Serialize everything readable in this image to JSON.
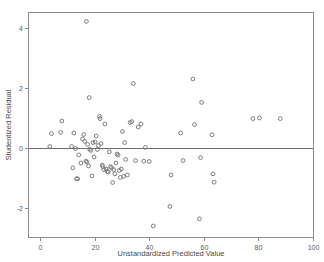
{
  "chart_data": {
    "type": "scatter",
    "title": "",
    "xlabel": "Unstandardized Predicted Value",
    "ylabel": "Studentized Residual",
    "xlim": [
      -2.5,
      102
    ],
    "ylim": [
      -3.0,
      4.7
    ],
    "xticks": [
      0,
      20,
      40,
      60,
      80,
      100
    ],
    "yticks": [
      -2,
      0,
      2,
      4
    ],
    "xtick_labels": [
      "0",
      "20",
      "40",
      "60",
      "80",
      "100"
    ],
    "ytick_labels": [
      "-2",
      "0",
      "2",
      "4"
    ],
    "grid": false,
    "legend": null,
    "reference_lines": [
      {
        "orientation": "horizontal",
        "y": 0,
        "color": "#6e6e6e"
      }
    ],
    "marker": {
      "shape": "open-circle",
      "radius": 1.9,
      "stroke": "#707070",
      "fill": "none"
    },
    "series": [
      {
        "name": "Residuals",
        "points": [
          [
            3.6,
            0.05
          ],
          [
            4.2,
            0.48
          ],
          [
            7.6,
            0.52
          ],
          [
            8.0,
            0.9
          ],
          [
            11.6,
            0.05
          ],
          [
            12.0,
            -0.66
          ],
          [
            12.4,
            0.5
          ],
          [
            13.0,
            -0.02
          ],
          [
            13.4,
            -1.02
          ],
          [
            13.8,
            -1.03
          ],
          [
            14.2,
            -0.23
          ],
          [
            15.0,
            -0.5
          ],
          [
            15.6,
            0.3
          ],
          [
            16.0,
            0.45
          ],
          [
            16.4,
            0.22
          ],
          [
            16.8,
            -0.44
          ],
          [
            17.0,
            4.22
          ],
          [
            17.2,
            -0.47
          ],
          [
            17.4,
            0.12
          ],
          [
            17.8,
            -0.6
          ],
          [
            18.0,
            1.68
          ],
          [
            18.2,
            -0.04
          ],
          [
            18.6,
            -0.08
          ],
          [
            19.0,
            -0.93
          ],
          [
            19.4,
            0.18
          ],
          [
            19.8,
            -0.3
          ],
          [
            20.2,
            0.2
          ],
          [
            20.6,
            0.4
          ],
          [
            21.0,
            -0.05
          ],
          [
            21.4,
            0.08
          ],
          [
            21.8,
            1.05
          ],
          [
            22.0,
            0.98
          ],
          [
            22.4,
            0.15
          ],
          [
            22.8,
            -0.57
          ],
          [
            23.0,
            -0.62
          ],
          [
            23.4,
            -0.72
          ],
          [
            23.8,
            0.8
          ],
          [
            24.2,
            -0.7
          ],
          [
            24.6,
            -0.78
          ],
          [
            25.0,
            -0.8
          ],
          [
            25.4,
            -0.13
          ],
          [
            25.8,
            -0.62
          ],
          [
            26.2,
            -0.66
          ],
          [
            26.6,
            -1.15
          ],
          [
            27.0,
            -0.72
          ],
          [
            27.4,
            -0.86
          ],
          [
            27.8,
            -0.5
          ],
          [
            28.2,
            -0.2
          ],
          [
            28.6,
            -0.24
          ],
          [
            29.0,
            -0.75
          ],
          [
            29.4,
            -0.98
          ],
          [
            29.8,
            -0.7
          ],
          [
            30.2,
            0.55
          ],
          [
            30.6,
            -0.95
          ],
          [
            31.0,
            0.18
          ],
          [
            31.4,
            -0.38
          ],
          [
            32.0,
            -0.9
          ],
          [
            33.0,
            0.85
          ],
          [
            33.6,
            0.88
          ],
          [
            34.2,
            2.15
          ],
          [
            35.0,
            -0.42
          ],
          [
            36.0,
            0.7
          ],
          [
            37.0,
            0.8
          ],
          [
            38.0,
            -0.44
          ],
          [
            38.6,
            0.02
          ],
          [
            40.0,
            -0.45
          ],
          [
            41.5,
            -2.6
          ],
          [
            47.6,
            -1.95
          ],
          [
            48.0,
            -0.9
          ],
          [
            51.5,
            0.5
          ],
          [
            52.4,
            -0.42
          ],
          [
            56.0,
            2.3
          ],
          [
            56.6,
            0.78
          ],
          [
            58.4,
            -2.36
          ],
          [
            58.8,
            -0.32
          ],
          [
            59.2,
            1.52
          ],
          [
            63.0,
            0.44
          ],
          [
            63.4,
            -0.86
          ],
          [
            63.8,
            -1.14
          ],
          [
            78.0,
            0.98
          ],
          [
            80.4,
            1.0
          ],
          [
            88.0,
            0.98
          ]
        ]
      }
    ]
  },
  "axes": {
    "x_title": "Unstandardized Predicted Value",
    "y_title": "Studentized Residual"
  }
}
